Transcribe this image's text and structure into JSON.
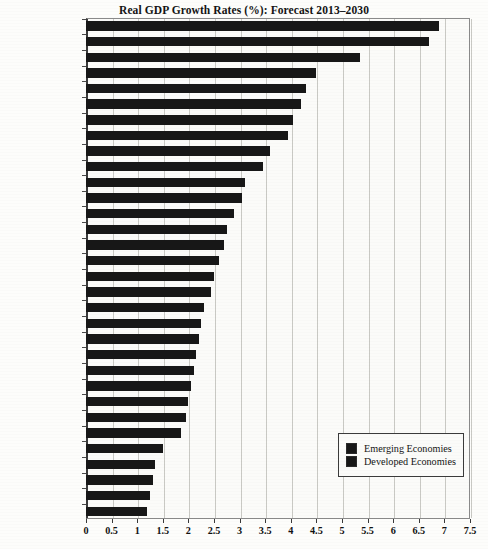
{
  "chart_data": {
    "type": "bar",
    "orientation": "horizontal",
    "title": "Real GDP Growth Rates (%): Forecast 2013–2030",
    "xlabel": "",
    "ylabel": "",
    "xlim": [
      0,
      7.5
    ],
    "xticks": [
      "0",
      "0.5",
      "1",
      "1.5",
      "2",
      "2.5",
      "3",
      "3.5",
      "4",
      "4.5",
      "5",
      "5.5",
      "6",
      "6.5",
      "7",
      "7.5"
    ],
    "xtick_values": [
      0,
      0.5,
      1,
      1.5,
      2,
      2.5,
      3,
      3.5,
      4,
      4.5,
      5,
      5.5,
      6,
      6.5,
      7,
      7.5
    ],
    "grid": true,
    "grid_axis": "x",
    "legend_position": "bottom-right",
    "legend": [
      {
        "label": "Emerging Economies",
        "color": "#171717"
      },
      {
        "label": "Developed Economies",
        "color": "#171717"
      }
    ],
    "categories": [
      "India",
      "China",
      "Indonesia",
      "Turkey",
      "Saudi Arabia",
      "Brazil",
      "Chile",
      "South Africa",
      "Argentina",
      "Mexico",
      "Australia",
      "Russia",
      "Norway",
      "Korea",
      "Israel",
      "Poland",
      "Hungary",
      "Sweden",
      "United States",
      "Switzerland",
      "World",
      "Finland",
      "Canada",
      "France",
      "Spain",
      "United Kingdom",
      "Netherlands",
      "Austria",
      "Italy",
      "Denmark",
      "Germany",
      "Japan"
    ],
    "values": [
      6.9,
      6.7,
      5.35,
      4.5,
      4.3,
      4.2,
      4.05,
      3.95,
      3.6,
      3.45,
      3.1,
      3.05,
      2.9,
      2.75,
      2.7,
      2.6,
      2.5,
      2.45,
      2.3,
      2.25,
      2.2,
      2.15,
      2.1,
      2.05,
      2.0,
      1.95,
      1.85,
      1.5,
      1.35,
      1.3,
      1.25,
      1.2
    ],
    "groups": [
      "Emerging Economies",
      "Emerging Economies",
      "Emerging Economies",
      "Emerging Economies",
      "Emerging Economies",
      "Emerging Economies",
      "Emerging Economies",
      "Emerging Economies",
      "Emerging Economies",
      "Emerging Economies",
      "Developed Economies",
      "Emerging Economies",
      "Developed Economies",
      "Developed Economies",
      "Developed Economies",
      "Emerging Economies",
      "Emerging Economies",
      "Developed Economies",
      "Developed Economies",
      "Developed Economies",
      "World",
      "Developed Economies",
      "Developed Economies",
      "Developed Economies",
      "Developed Economies",
      "Developed Economies",
      "Developed Economies",
      "Developed Economies",
      "Developed Economies",
      "Developed Economies",
      "Developed Economies",
      "Developed Economies"
    ],
    "bar_color": "#171717"
  }
}
